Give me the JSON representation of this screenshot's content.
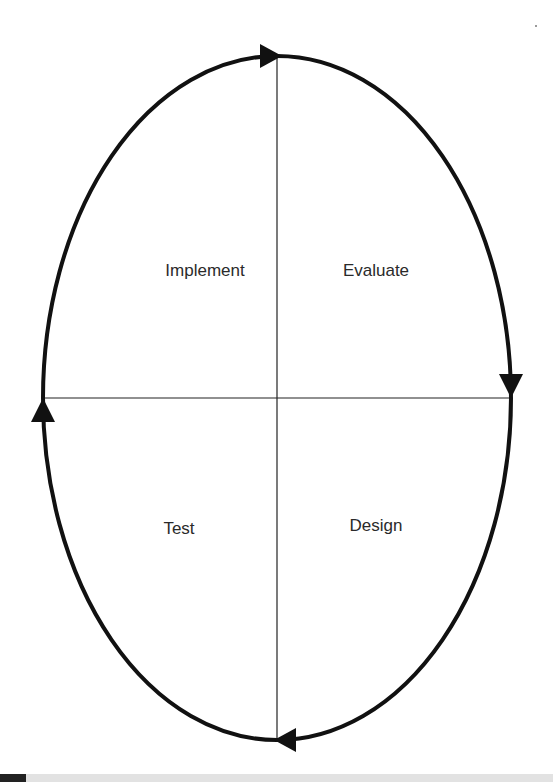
{
  "diagram": {
    "type": "cycle",
    "shape": "ellipse",
    "center": [
      277,
      398
    ],
    "radii": [
      234,
      342
    ],
    "stroke_color": "#111111",
    "divider_color": "#222222",
    "quadrants": [
      {
        "position": "top-left",
        "label": "Implement"
      },
      {
        "position": "top-right",
        "label": "Evaluate"
      },
      {
        "position": "bottom-right",
        "label": "Design"
      },
      {
        "position": "bottom-left",
        "label": "Test"
      }
    ],
    "arrows": [
      {
        "position": "top",
        "direction": "right"
      },
      {
        "position": "right",
        "direction": "down"
      },
      {
        "position": "bottom",
        "direction": "left"
      },
      {
        "position": "left",
        "direction": "up"
      }
    ],
    "flow_order": [
      "Design",
      "Test",
      "Implement",
      "Evaluate"
    ],
    "flow_direction": "clockwise"
  }
}
